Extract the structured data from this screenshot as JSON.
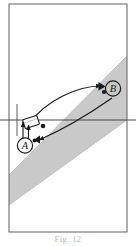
{
  "figure": {
    "caption": "Fig. 12",
    "colors": {
      "background": "#ffffff",
      "frame_stroke": "#6e6e6e",
      "band_fill": "#c9c9c9",
      "band_edge": "#b0b0b0",
      "ink": "#1a1a1a",
      "axis_line": "#4a4a4a",
      "vehicle_fill": "#ffffff"
    },
    "frame": {
      "x": 9,
      "y": 4,
      "width": 118,
      "height": 228
    },
    "axis": {
      "horizontal_y": 120,
      "vertical_x": 17,
      "horizontal_label": "",
      "vertical_label": ""
    },
    "shaded_band": {
      "name": "grey-diagonal-band",
      "upper_edge": [
        [
          9,
          175
        ],
        [
          127,
          56
        ]
      ],
      "lower_edge": [
        [
          9,
          205
        ],
        [
          127,
          120
        ]
      ]
    },
    "markers": [
      {
        "id": "A",
        "label": "A",
        "cx": 25,
        "cy": 145,
        "r": 7.5,
        "has_arrow_marker": true,
        "arrow_x": 36,
        "arrow_y": 139
      },
      {
        "id": "B",
        "label": "B",
        "cx": 113,
        "cy": 89,
        "r": 7.5,
        "has_arrow_marker": true,
        "arrow_x": 102,
        "arrow_y": 86
      }
    ],
    "vehicle": {
      "name": "vehicle-icon",
      "x": 24,
      "y": 118,
      "width": 14,
      "height": 9,
      "rotation": -18
    },
    "trajectories": [
      {
        "id": "upper-curve",
        "direction": "to-B",
        "from": [
          30,
          124
        ],
        "to": [
          103,
          86
        ]
      },
      {
        "id": "lower-curve",
        "direction": "to-A",
        "from": [
          112,
          98
        ],
        "to": [
          37,
          140
        ]
      }
    ],
    "dots": [
      {
        "name": "sensor-dot-1",
        "cx": 43,
        "cy": 126,
        "r": 2.2
      },
      {
        "name": "sensor-dot-2",
        "cx": 34,
        "cy": 141,
        "r": 1.8
      },
      {
        "name": "sensor-dot-3",
        "cx": 104,
        "cy": 92,
        "r": 2.0
      }
    ]
  }
}
